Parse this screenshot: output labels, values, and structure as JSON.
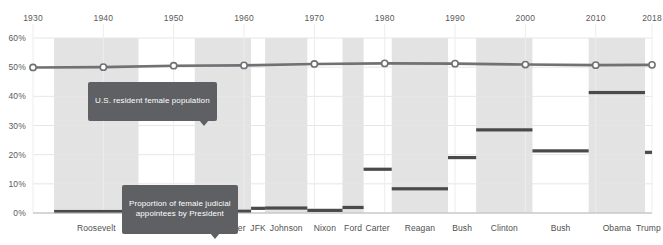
{
  "chart_data": {
    "type": "line",
    "title": "",
    "xlabel": "",
    "ylabel": "",
    "x_ticks": [
      "1930",
      "1940",
      "1950",
      "1960",
      "1970",
      "1980",
      "1990",
      "2000",
      "2010",
      "2018"
    ],
    "x_tick_values": [
      1930,
      1940,
      1950,
      1960,
      1970,
      1980,
      1990,
      2000,
      2010,
      2018
    ],
    "xlim": [
      1930,
      2018
    ],
    "y_ticks": [
      "0%",
      "10%",
      "20%",
      "30%",
      "40%",
      "50%",
      "60%"
    ],
    "y_tick_values": [
      0,
      10,
      20,
      30,
      40,
      50,
      60
    ],
    "ylim": [
      0,
      60
    ],
    "grid": true,
    "legend_position": "inline-annotation",
    "series": [
      {
        "name": "U.S. resident female population",
        "type": "line",
        "marker": "circle",
        "color": "#6f7174",
        "x": [
          1930,
          1940,
          1950,
          1960,
          1970,
          1980,
          1990,
          2000,
          2010,
          2018
        ],
        "values": [
          49.9,
          50.0,
          50.5,
          50.6,
          51.1,
          51.3,
          51.2,
          50.9,
          50.7,
          50.8
        ]
      },
      {
        "name": "Proportion of female judicial appointees by President",
        "type": "step-bars",
        "color": "#4a4a4a",
        "categories": [
          "Roosevelt",
          "Truman",
          "Eisenhower",
          "JFK",
          "Johnson",
          "Nixon",
          "Ford",
          "Carter",
          "Reagan",
          "Bush",
          "Clinton",
          "Bush",
          "Obama",
          "Trump"
        ],
        "values": [
          0.5,
          0.5,
          0.6,
          1.6,
          1.7,
          0.9,
          1.9,
          15.0,
          8.3,
          19.0,
          28.5,
          21.3,
          41.3,
          20.8
        ],
        "spans": [
          [
            1933,
            1945
          ],
          [
            1945,
            1953
          ],
          [
            1953,
            1961
          ],
          [
            1961,
            1963
          ],
          [
            1963,
            1969
          ],
          [
            1969,
            1974
          ],
          [
            1974,
            1977
          ],
          [
            1977,
            1981
          ],
          [
            1981,
            1989
          ],
          [
            1989,
            1993
          ],
          [
            1993,
            2001
          ],
          [
            2001,
            2009
          ],
          [
            2009,
            2017
          ],
          [
            2017,
            2018
          ]
        ]
      }
    ],
    "annotations": [
      {
        "name": "population-callout",
        "text": "U.S. resident female population",
        "points_to_series": "U.S. resident female population"
      },
      {
        "name": "appointees-callout",
        "text": "Proportion of female judicial\nappointees by President",
        "points_to_series": "Proportion of female judicial appointees by President"
      }
    ],
    "band_shading": {
      "shaded_color": "#e2e2e2",
      "unshaded_color": "#ffffff",
      "description": "Alternating vertical bands mark each presidential term"
    }
  },
  "colors": {
    "line": "#6f7174",
    "bar": "#4a4a4a",
    "band": "#e3e3e3",
    "grid": "#e6e6e6",
    "axis_text": "#5a5a5a",
    "callout_bg": "#5e6063",
    "callout_text": "#ffffff"
  }
}
